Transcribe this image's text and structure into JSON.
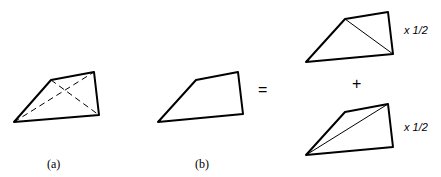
{
  "figure": {
    "panels": [
      {
        "id": "a",
        "label": "(a)",
        "description": "quadrilateral with both diagonals dashed"
      },
      {
        "id": "b",
        "label": "(b)",
        "description": "quadrilateral"
      }
    ],
    "operators": {
      "equals": "=",
      "plus": "+"
    },
    "decomposition": [
      {
        "description": "quadrilateral split by diagonal from top-left to bottom-right",
        "factor": "x 1/2"
      },
      {
        "description": "quadrilateral split by diagonal from bottom-left to top-right",
        "factor": "x 1/2"
      }
    ],
    "colors": {
      "stroke": "#000000",
      "background": "#ffffff"
    }
  }
}
